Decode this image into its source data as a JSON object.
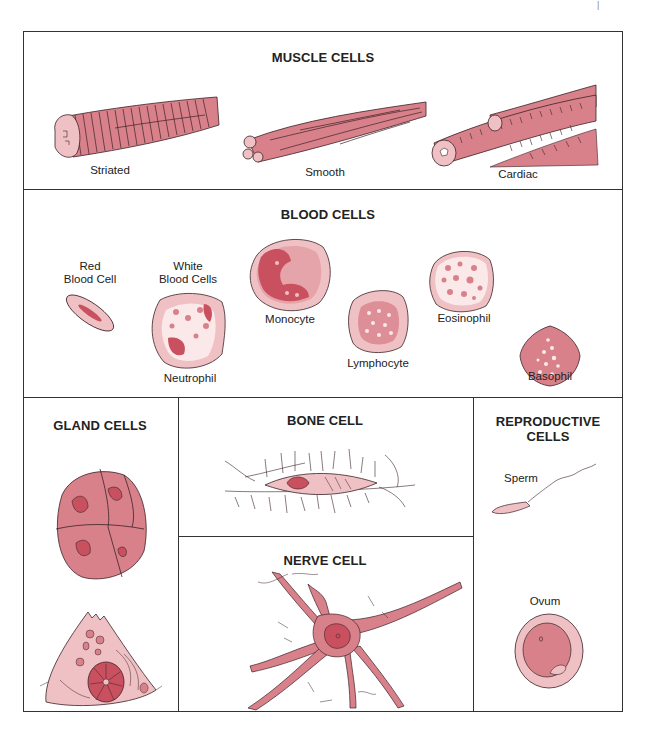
{
  "header": {
    "page_mark": "|"
  },
  "colors": {
    "cell_fill": "#d9818b",
    "cell_light": "#efc1c4",
    "cell_dark": "#c9505e",
    "outline": "#3a2226",
    "border": "#333333"
  },
  "sections": {
    "muscle": {
      "title": "MUSCLE CELLS",
      "items": [
        {
          "label": "Striated"
        },
        {
          "label": "Smooth"
        },
        {
          "label": "Cardiac"
        }
      ]
    },
    "blood": {
      "title": "BLOOD CELLS",
      "items": [
        {
          "label_line1": "Red",
          "label_line2": "Blood Cell"
        },
        {
          "label_line1": "White",
          "label_line2": "Blood Cells"
        },
        {
          "label": "Neutrophil"
        },
        {
          "label": "Monocyte"
        },
        {
          "label": "Lymphocyte"
        },
        {
          "label": "Eosinophil"
        },
        {
          "label": "Basophil"
        }
      ]
    },
    "gland": {
      "title": "GLAND CELLS"
    },
    "bone": {
      "title": "BONE CELL"
    },
    "nerve": {
      "title": "NERVE CELL"
    },
    "reproductive": {
      "title_line1": "REPRODUCTIVE",
      "title_line2": "CELLS",
      "items": [
        {
          "label": "Sperm"
        },
        {
          "label": "Ovum"
        }
      ]
    }
  }
}
